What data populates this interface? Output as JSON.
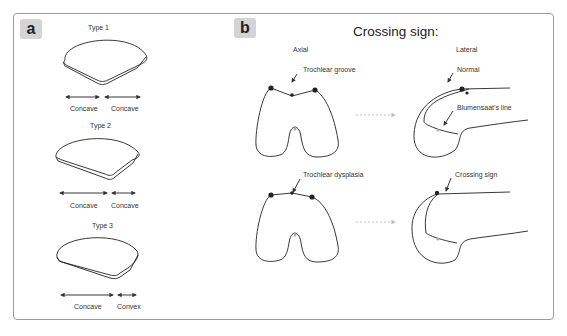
{
  "panel_a": {
    "label": "a",
    "types": [
      {
        "title": "Type 1",
        "left": "Concave",
        "right": "Concave"
      },
      {
        "title": "Type 2",
        "left": "Concave",
        "right": "Concave"
      },
      {
        "title": "Type 3",
        "left": "Concave",
        "right": "Convex"
      }
    ]
  },
  "panel_b": {
    "label": "b",
    "title": "Crossing sign:",
    "axial_heading": "Axial",
    "lateral_heading": "Lateral",
    "annotations": {
      "trochlear_groove": "Trochlear groove",
      "normal": "Normal",
      "blumensaat": "Blumensaat’s line",
      "trochlear_dysplasia": "Trochlear dysplasia",
      "crossing_sign": "Crossing sign"
    }
  }
}
